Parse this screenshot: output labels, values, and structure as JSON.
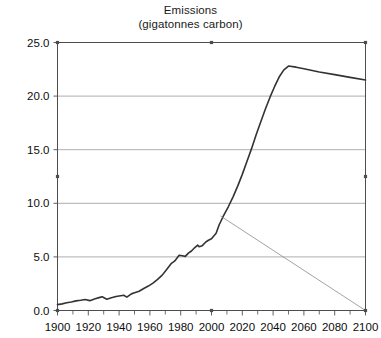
{
  "chart_data": {
    "type": "line",
    "title": "Emissions",
    "subtitle": "(gigatonnes carbon)",
    "xlabel": "",
    "ylabel": "",
    "xlim": [
      1900,
      2100
    ],
    "ylim": [
      0.0,
      25.0
    ],
    "xticks": [
      1900,
      1920,
      1940,
      1960,
      1980,
      2000,
      2020,
      2040,
      2060,
      2080,
      2100
    ],
    "xtick_labels": [
      "1900",
      "1920",
      "1940",
      "1960",
      "1980",
      "2000",
      "2020",
      "2040",
      "2060",
      "2080",
      "2100"
    ],
    "xminor_ticks": [
      1910,
      1930,
      1950,
      1970,
      1990,
      2010,
      2030,
      2050,
      2070,
      2090
    ],
    "yticks": [
      0.0,
      5.0,
      10.0,
      15.0,
      20.0,
      25.0
    ],
    "ytick_labels": [
      "0.0",
      "5.0",
      "10.0",
      "15.0",
      "20.0",
      "25.0"
    ],
    "grid": "horizontal",
    "grid_color": "#999999",
    "frame_color": "#4d4d4d",
    "legend": "none",
    "series": [
      {
        "name": "emissions-reference",
        "style": "thick",
        "color": "#333333",
        "width": 1.6,
        "points": [
          [
            1900,
            0.55
          ],
          [
            1903,
            0.62
          ],
          [
            1906,
            0.72
          ],
          [
            1909,
            0.8
          ],
          [
            1912,
            0.9
          ],
          [
            1915,
            0.95
          ],
          [
            1918,
            1.02
          ],
          [
            1921,
            0.92
          ],
          [
            1924,
            1.08
          ],
          [
            1927,
            1.2
          ],
          [
            1929,
            1.28
          ],
          [
            1932,
            1.05
          ],
          [
            1935,
            1.18
          ],
          [
            1938,
            1.3
          ],
          [
            1940,
            1.35
          ],
          [
            1943,
            1.42
          ],
          [
            1945,
            1.25
          ],
          [
            1948,
            1.55
          ],
          [
            1950,
            1.65
          ],
          [
            1953,
            1.8
          ],
          [
            1956,
            2.05
          ],
          [
            1959,
            2.28
          ],
          [
            1962,
            2.55
          ],
          [
            1965,
            2.9
          ],
          [
            1968,
            3.3
          ],
          [
            1971,
            3.85
          ],
          [
            1974,
            4.4
          ],
          [
            1976,
            4.6
          ],
          [
            1979,
            5.15
          ],
          [
            1981,
            5.1
          ],
          [
            1983,
            5.05
          ],
          [
            1985,
            5.35
          ],
          [
            1987,
            5.55
          ],
          [
            1989,
            5.85
          ],
          [
            1991,
            6.1
          ],
          [
            1992,
            5.95
          ],
          [
            1994,
            6.05
          ],
          [
            1996,
            6.35
          ],
          [
            1998,
            6.55
          ],
          [
            2000,
            6.7
          ],
          [
            2003,
            7.2
          ],
          [
            2005,
            8.0
          ],
          [
            2008,
            8.9
          ],
          [
            2011,
            9.7
          ],
          [
            2014,
            10.6
          ],
          [
            2017,
            11.6
          ],
          [
            2020,
            12.7
          ],
          [
            2023,
            13.9
          ],
          [
            2026,
            15.1
          ],
          [
            2029,
            16.4
          ],
          [
            2032,
            17.6
          ],
          [
            2035,
            18.8
          ],
          [
            2038,
            19.9
          ],
          [
            2041,
            20.9
          ],
          [
            2044,
            21.8
          ],
          [
            2047,
            22.45
          ],
          [
            2050,
            22.8
          ],
          [
            2055,
            22.7
          ],
          [
            2060,
            22.55
          ],
          [
            2070,
            22.25
          ],
          [
            2080,
            22.0
          ],
          [
            2090,
            21.75
          ],
          [
            2100,
            21.5
          ]
        ]
      },
      {
        "name": "emissions-reduction-path",
        "style": "thin",
        "color": "#8c8c8c",
        "width": 0.8,
        "points": [
          [
            2006,
            8.8
          ],
          [
            2100,
            0.0
          ]
        ]
      }
    ]
  }
}
